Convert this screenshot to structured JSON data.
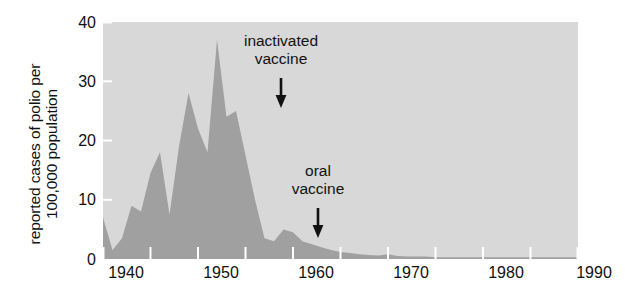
{
  "chart_data": {
    "type": "area",
    "title": "",
    "subtitle": "",
    "xlabel": "",
    "ylabel": "reported cases of polio per 100,000 population",
    "ylabel_lines": [
      "reported cases of polio per",
      "100,000 population"
    ],
    "xlim": [
      1940,
      1990
    ],
    "ylim": [
      0,
      40
    ],
    "grid": false,
    "legend": null,
    "x_ticks": [
      1940,
      1950,
      1960,
      1970,
      1980,
      1990
    ],
    "x_tick_labels": [
      "1940",
      "1950",
      "1960",
      "1970",
      "1980",
      "1990"
    ],
    "x_minor_ticks": [
      1945,
      1955,
      1965,
      1975,
      1985
    ],
    "y_ticks": [
      0,
      10,
      20,
      30,
      40
    ],
    "y_tick_labels": [
      "0",
      "10",
      "20",
      "30",
      "40"
    ],
    "series": [
      {
        "name": "reported polio cases per 100,000",
        "fill_color": "#a0a0a0",
        "x": [
          1940,
          1941,
          1942,
          1943,
          1944,
          1945,
          1946,
          1947,
          1948,
          1949,
          1950,
          1951,
          1952,
          1953,
          1954,
          1955,
          1956,
          1957,
          1958,
          1959,
          1960,
          1961,
          1962,
          1963,
          1964,
          1965,
          1966,
          1967,
          1968,
          1969,
          1970,
          1971,
          1972,
          1973,
          1974,
          1975,
          1976,
          1977,
          1978,
          1979,
          1980,
          1981,
          1982,
          1983,
          1984,
          1985,
          1986,
          1987,
          1988,
          1989,
          1990
        ],
        "y": [
          7.0,
          1.5,
          3.5,
          9.0,
          8.0,
          14.5,
          18.0,
          7.5,
          19.0,
          28.0,
          22.0,
          18.0,
          37.0,
          24.0,
          25.0,
          17.5,
          10.0,
          3.5,
          3.0,
          5.0,
          4.5,
          3.0,
          2.5,
          2.0,
          1.5,
          1.2,
          1.0,
          0.8,
          0.7,
          0.6,
          0.8,
          0.5,
          0.4,
          0.4,
          0.4,
          0.3,
          0.3,
          0.3,
          0.3,
          0.3,
          0.3,
          0.3,
          0.3,
          0.3,
          0.3,
          0.3,
          0.3,
          0.3,
          0.3,
          0.3,
          0.3
        ]
      }
    ],
    "annotations": [
      {
        "id": "inactivated-vaccine",
        "lines": [
          "inactivated",
          "vaccine"
        ],
        "x": 1955,
        "arrow": "down"
      },
      {
        "id": "oral-vaccine",
        "lines": [
          "oral",
          "vaccine"
        ],
        "x": 1962,
        "arrow": "down"
      }
    ],
    "colors": {
      "plot_background": "#d8d8d8",
      "area_fill": "#a0a0a0",
      "text": "#111111",
      "tick": "#ffffff",
      "page_background": "#ffffff"
    }
  }
}
